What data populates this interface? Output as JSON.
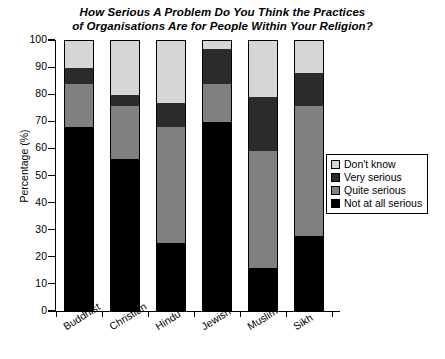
{
  "chart_data": {
    "type": "bar",
    "subtype": "stacked-percentage",
    "title": "How Serious A Problem Do You Think the Practices of Organisations Are for People Within Your Religion?",
    "title_line1": "How Serious A Problem Do You Think the Practices",
    "title_line2": "of Organisations Are for People Within Your Religion?",
    "xlabel": "",
    "ylabel": "Percentage (%)",
    "ylim": [
      0,
      100
    ],
    "yticks": [
      0,
      10,
      20,
      30,
      40,
      50,
      60,
      70,
      80,
      90,
      100
    ],
    "ytick_labels": [
      "0",
      "10",
      "20",
      "30",
      "40",
      "50",
      "60",
      "70",
      "80",
      "90",
      "100"
    ],
    "grid": false,
    "legend_position": "right-middle",
    "categories": [
      "Buddhist",
      "Christian",
      "Hindu",
      "Jewish",
      "Muslim",
      "Sikh"
    ],
    "series": [
      {
        "name": "Not at all serious",
        "color": "#000000",
        "values": [
          68,
          56,
          25,
          70,
          15.5,
          27.5
        ]
      },
      {
        "name": "Quite serious",
        "color": "#808080",
        "values": [
          16,
          20,
          43,
          14,
          43.5,
          48.5
        ]
      },
      {
        "name": "Very serious",
        "color": "#2b2b2b",
        "values": [
          6,
          4,
          9,
          13,
          20,
          12
        ]
      },
      {
        "name": "Don't know",
        "color": "#d6d6d6",
        "values": [
          10,
          20,
          23,
          3,
          21,
          12
        ]
      }
    ],
    "legend_entries": [
      {
        "label": "Don't know",
        "color": "#d6d6d6"
      },
      {
        "label": "Very serious",
        "color": "#2b2b2b"
      },
      {
        "label": "Quite serious",
        "color": "#808080"
      },
      {
        "label": "Not at all serious",
        "color": "#000000"
      }
    ]
  }
}
